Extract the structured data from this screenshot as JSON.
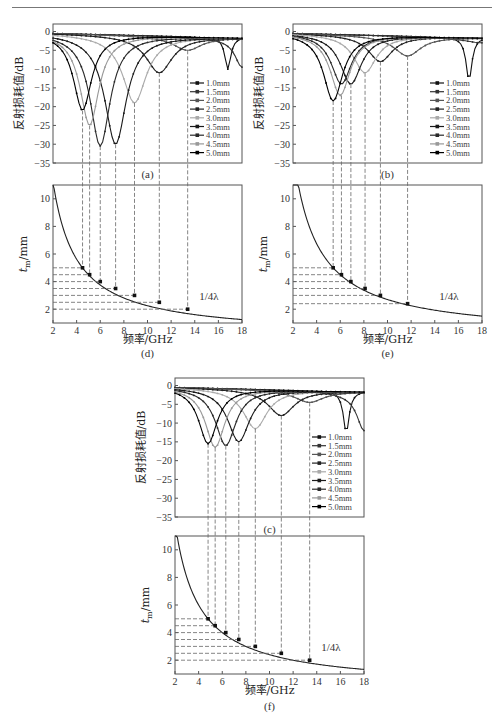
{
  "page": {
    "header_rule": true
  },
  "chart_data": [
    {
      "id": "a",
      "type": "line",
      "caption": "(a)",
      "xlabel": "频率/GHz",
      "ylabel": "反射损耗值/dB",
      "xlim": [
        2,
        18
      ],
      "ylim": [
        -35,
        2
      ],
      "yticks": [
        0,
        -5,
        -10,
        -15,
        -20,
        -25,
        -30,
        -35
      ],
      "legend": [
        "1.0mm",
        "1.5mm",
        "2.0mm",
        "2.5mm",
        "3.0mm",
        "3.5mm",
        "4.0mm",
        "4.5mm",
        "5.0mm"
      ],
      "legend_position": "lower right",
      "series": [
        {
          "name": "1.0mm",
          "min_freq": 18,
          "min_rl": -1.5
        },
        {
          "name": "1.5mm",
          "min_freq": 18,
          "min_rl": -2.5
        },
        {
          "name": "2.0mm",
          "min_freq": 13.4,
          "min_rl": -5
        },
        {
          "name": "2.5mm",
          "min_freq": 11.0,
          "min_rl": -11
        },
        {
          "name": "3.0mm",
          "min_freq": 8.9,
          "min_rl": -19
        },
        {
          "name": "3.5mm",
          "min_freq": 7.3,
          "min_rl": -30
        },
        {
          "name": "4.0mm",
          "min_freq": 6.0,
          "min_rl": -30.5
        },
        {
          "name": "4.5mm",
          "min_freq": 5.1,
          "min_rl": -25
        },
        {
          "name": "5.0mm",
          "min_freq": 4.5,
          "min_rl": -21
        }
      ],
      "secondary_peaks": [
        {
          "freq": 16.8,
          "rl": -10.5
        },
        {
          "freq": 18,
          "rl": -10
        }
      ]
    },
    {
      "id": "b",
      "type": "line",
      "caption": "(b)",
      "xlabel": "频率/GHz",
      "ylabel": "反射损耗值/dB",
      "xlim": [
        2,
        18
      ],
      "ylim": [
        -35,
        2
      ],
      "yticks": [
        0,
        -5,
        -10,
        -15,
        -20,
        -25,
        -30,
        -35
      ],
      "legend": [
        "1.0mm",
        "1.5mm",
        "2.0mm",
        "2.5mm",
        "3.0mm",
        "3.5mm",
        "4.0mm",
        "4.5mm",
        "5.0mm"
      ],
      "legend_position": "lower right",
      "series": [
        {
          "name": "1.0mm",
          "min_freq": 18,
          "min_rl": -1.5
        },
        {
          "name": "1.5mm",
          "min_freq": 18,
          "min_rl": -3
        },
        {
          "name": "2.0mm",
          "min_freq": 11.7,
          "min_rl": -6.5
        },
        {
          "name": "2.5mm",
          "min_freq": 9.4,
          "min_rl": -8
        },
        {
          "name": "3.0mm",
          "min_freq": 8.1,
          "min_rl": -11
        },
        {
          "name": "3.5mm",
          "min_freq": 6.9,
          "min_rl": -14
        },
        {
          "name": "4.0mm",
          "min_freq": 6.1,
          "min_rl": -14
        },
        {
          "name": "4.5mm",
          "min_freq": 6.0,
          "min_rl": -17
        },
        {
          "name": "5.0mm",
          "min_freq": 5.4,
          "min_rl": -18.5
        }
      ],
      "secondary_peaks": [
        {
          "freq": 16.9,
          "rl": -13.5
        }
      ]
    },
    {
      "id": "c",
      "type": "line",
      "caption": "(c)",
      "xlabel": "频率/GHz",
      "ylabel": "反射损耗值/dB",
      "xlim": [
        2,
        18
      ],
      "ylim": [
        -35,
        2
      ],
      "yticks": [
        0,
        -5,
        -10,
        -15,
        -20,
        -25,
        -30,
        -35
      ],
      "legend": [
        "1.0mm",
        "1.5mm",
        "2.0mm",
        "2.5mm",
        "3.0mm",
        "3.5mm",
        "4.0mm",
        "4.5mm",
        "5.0mm"
      ],
      "legend_position": "lower right",
      "series": [
        {
          "name": "1.0mm",
          "min_freq": 18,
          "min_rl": -1.5
        },
        {
          "name": "1.5mm",
          "min_freq": 18,
          "min_rl": -3
        },
        {
          "name": "2.0mm",
          "min_freq": 13.4,
          "min_rl": -4.5
        },
        {
          "name": "2.5mm",
          "min_freq": 11.0,
          "min_rl": -8
        },
        {
          "name": "3.0mm",
          "min_freq": 8.8,
          "min_rl": -11.5
        },
        {
          "name": "3.5mm",
          "min_freq": 7.4,
          "min_rl": -15
        },
        {
          "name": "4.0mm",
          "min_freq": 6.3,
          "min_rl": -16
        },
        {
          "name": "4.5mm",
          "min_freq": 5.4,
          "min_rl": -16.5
        },
        {
          "name": "5.0mm",
          "min_freq": 4.8,
          "min_rl": -15.5
        }
      ],
      "secondary_peaks": [
        {
          "freq": 16.5,
          "rl": -13
        },
        {
          "freq": 18,
          "rl": -12
        }
      ]
    },
    {
      "id": "d",
      "type": "line",
      "caption": "(d)",
      "xlabel": "频率/GHz",
      "ylabel": "t_m/mm",
      "xlim": [
        2,
        18
      ],
      "ylim": [
        1,
        11
      ],
      "xticks": [
        2,
        4,
        6,
        8,
        10,
        12,
        14,
        16,
        18
      ],
      "yticks": [
        2,
        4,
        6,
        8,
        10
      ],
      "annotation": "1/4λ",
      "curve": "t = 20/f (quarter-wavelength)",
      "points": [
        [
          4.5,
          5.0
        ],
        [
          5.1,
          4.5
        ],
        [
          6.0,
          4.0
        ],
        [
          7.3,
          3.5
        ],
        [
          8.9,
          3.0
        ],
        [
          11.0,
          2.5
        ],
        [
          13.4,
          2.0
        ]
      ]
    },
    {
      "id": "e",
      "type": "line",
      "caption": "(e)",
      "xlabel": "频率/GHz",
      "ylabel": "t_m/mm",
      "xlim": [
        2,
        18
      ],
      "ylim": [
        1,
        11
      ],
      "xticks": [
        2,
        4,
        6,
        8,
        10,
        12,
        14,
        16,
        18
      ],
      "yticks": [
        2,
        4,
        6,
        8,
        10
      ],
      "annotation": "1/4λ",
      "curve": "t = 27/f (quarter-wavelength)",
      "points": [
        [
          5.4,
          5.0
        ],
        [
          6.1,
          4.5
        ],
        [
          6.9,
          4.0
        ],
        [
          8.1,
          3.5
        ],
        [
          9.4,
          3.0
        ],
        [
          11.7,
          2.4
        ]
      ]
    },
    {
      "id": "f",
      "type": "line",
      "caption": "(f)",
      "xlabel": "频率/GHz",
      "ylabel": "t_m/mm",
      "xlim": [
        2,
        18
      ],
      "ylim": [
        1,
        11
      ],
      "xticks": [
        2,
        4,
        6,
        8,
        10,
        12,
        14,
        16,
        18
      ],
      "yticks": [
        2,
        4,
        6,
        8,
        10
      ],
      "annotation": "1/4λ",
      "curve": "t = 24/f (quarter-wavelength)",
      "points": [
        [
          4.8,
          5.0
        ],
        [
          5.4,
          4.5
        ],
        [
          6.3,
          4.0
        ],
        [
          7.4,
          3.5
        ],
        [
          8.8,
          3.0
        ],
        [
          11.0,
          2.5
        ],
        [
          13.4,
          2.0
        ]
      ]
    }
  ],
  "colors": {
    "series": [
      "#111111",
      "#333333",
      "#555555",
      "#222222",
      "#aaaaaa",
      "#1a1a1a",
      "#2a2a2a",
      "#999999",
      "#000000"
    ],
    "frame": "#555555",
    "dashed": "#666666"
  }
}
